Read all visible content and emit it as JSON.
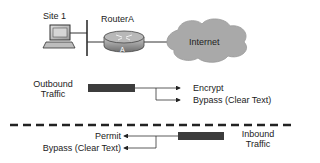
{
  "diagram": {
    "site_label": "Site 1",
    "router_label": "RouterA",
    "router_badge": "A",
    "cloud_label": "Internet",
    "outbound": {
      "label_line1": "Outbound",
      "label_line2": "Traffic",
      "actions": [
        "Encrypt",
        "Bypass (Clear Text)"
      ]
    },
    "inbound": {
      "label_line1": "Inbound",
      "label_line2": "Traffic",
      "actions": [
        "Permit",
        "Bypass (Clear Text)"
      ]
    },
    "colors": {
      "cloud_fill": "#a9a9a9",
      "router_fill": "#8c8c8c",
      "traffic_bar": "#3c3c3c",
      "line": "#333333"
    }
  }
}
